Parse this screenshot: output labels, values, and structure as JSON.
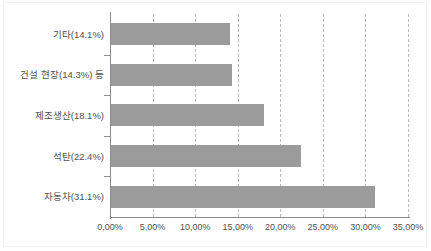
{
  "chart_data": {
    "type": "bar",
    "orientation": "horizontal",
    "title": "",
    "xlabel": "",
    "ylabel": "",
    "categories": [
      "기타(14.1%)",
      "건설 현장(14.3%) 등",
      "제조생산(18.1%)",
      "석탄(22.4%)",
      "자동차(31.1%)"
    ],
    "values": [
      14.1,
      14.3,
      18.1,
      22.4,
      31.1
    ],
    "xlim": [
      0,
      35
    ],
    "xticks": [
      0,
      5,
      10,
      15,
      20,
      25,
      30,
      35
    ],
    "xtick_labels": [
      "0,00%",
      "5,00%",
      "10,00%",
      "15,00%",
      "20,00%",
      "25,00%",
      "30,00%",
      "35,00%"
    ],
    "grid": "vertical-dashed",
    "legend": "none",
    "bar_color": "#9b9b9b",
    "gridline_color": "#b9b9b9",
    "axis_color": "#8d8d8d",
    "background_color": "#ffffff"
  }
}
